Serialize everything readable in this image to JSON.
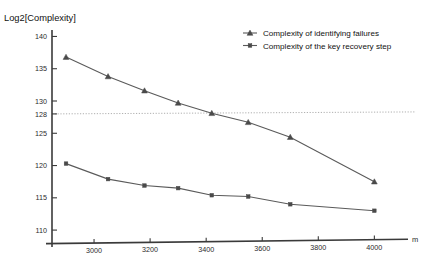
{
  "chart_data": {
    "type": "line",
    "title": "Log2[Complexity]",
    "xlabel": "m",
    "ylabel": "Log2[Complexity]",
    "xlim": [
      2850,
      4120
    ],
    "ylim": [
      108,
      141
    ],
    "grid": false,
    "legend_position": "top-right",
    "x_ticks": [
      3000,
      3200,
      3400,
      3600,
      3800,
      4000
    ],
    "x_tick_labels": [
      "3000",
      "3200",
      "3400",
      "3600",
      "3800",
      "4000"
    ],
    "y_ticks": [
      110,
      115,
      120,
      125,
      128,
      130,
      135,
      140
    ],
    "y_tick_labels": [
      "110",
      "115",
      "120",
      "125",
      "128",
      "130",
      "135",
      "140"
    ],
    "reference_lines": [
      {
        "axis": "y",
        "value": 128,
        "style": "dotted",
        "label": "128"
      }
    ],
    "x": [
      2900,
      3050,
      3180,
      3300,
      3420,
      3550,
      3700,
      4000
    ],
    "series": [
      {
        "name": "Complexity of identifying failures",
        "marker": "triangle",
        "values": [
          136.8,
          133.8,
          131.6,
          129.7,
          128.1,
          126.7,
          124.4,
          117.5
        ]
      },
      {
        "name": "Complexity of the key recovery step",
        "marker": "square",
        "values": [
          120.3,
          117.9,
          116.9,
          116.5,
          115.4,
          115.2,
          114.0,
          113.0
        ]
      }
    ]
  },
  "legend": {
    "entries": [
      {
        "label": "Complexity of identifying failures",
        "marker": "triangle"
      },
      {
        "label": "Complexity of the key recovery step",
        "marker": "square"
      }
    ]
  },
  "axes": {
    "y_axis_title": "Log2[Complexity]",
    "x_axis_name": "m"
  }
}
